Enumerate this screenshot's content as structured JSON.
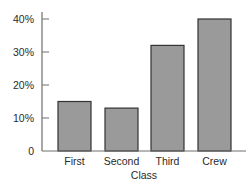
{
  "chart_data": {
    "type": "bar",
    "title": "",
    "xlabel": "Class",
    "ylabel": "",
    "categories": [
      "First",
      "Second",
      "Third",
      "Crew"
    ],
    "values": [
      15,
      13,
      32,
      40
    ],
    "unit": "%",
    "ylim": [
      0,
      40
    ],
    "yticks": [
      0,
      10,
      20,
      30,
      40
    ],
    "ytick_labels": [
      "0",
      "10%",
      "20%",
      "30%",
      "40%"
    ],
    "grid": false,
    "legend": null,
    "colors": {
      "bar_fill": "#9a9a9a",
      "bar_edge": "#333333",
      "axis": "#6e6e6e"
    }
  }
}
